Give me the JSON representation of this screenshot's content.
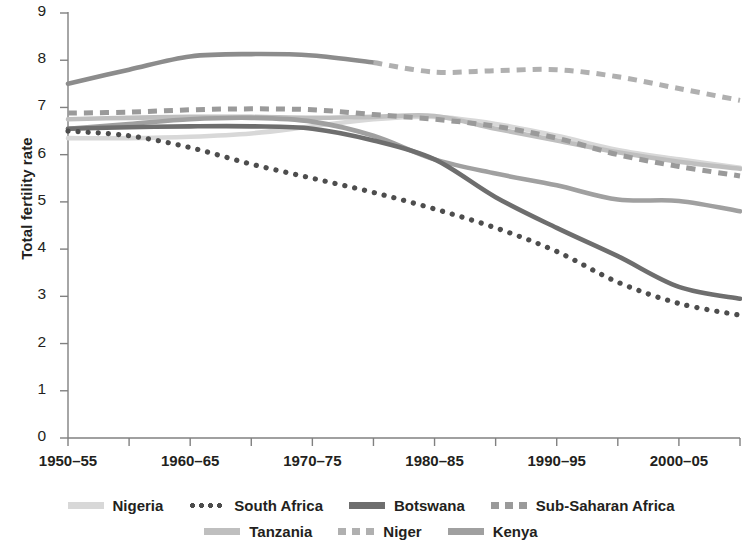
{
  "chart_data": {
    "type": "line",
    "title": "",
    "xlabel": "",
    "ylabel": "Total fertility rate",
    "ylim": [
      0,
      9
    ],
    "yticks": [
      0,
      1,
      2,
      3,
      4,
      5,
      6,
      7,
      8,
      9
    ],
    "grid": false,
    "legend_position": "bottom",
    "x": [
      "1950-55",
      "1955-60",
      "1960-65",
      "1965-70",
      "1970-75",
      "1975-80",
      "1980-85",
      "1985-90",
      "1990-95",
      "1995-2000",
      "2000-05",
      "2005-10"
    ],
    "xticks_labeled": [
      "1950–55",
      "1960–65",
      "1970–75",
      "1980–85",
      "1990–95",
      "2000–05"
    ],
    "series": [
      {
        "name": "Niger",
        "style": "solid-then-dashed",
        "color": "#8c8c8c",
        "values": [
          7.5,
          7.8,
          8.08,
          8.13,
          8.1,
          7.95,
          7.75,
          7.78,
          7.8,
          7.65,
          7.4,
          7.15
        ]
      },
      {
        "name": "Sub-Saharan Africa",
        "style": "dashed",
        "color": "#9a9a9a",
        "values": [
          6.88,
          6.9,
          6.95,
          6.97,
          6.95,
          6.85,
          6.75,
          6.6,
          6.35,
          6.0,
          5.75,
          5.55
        ]
      },
      {
        "name": "Tanzania",
        "style": "solid",
        "color": "#bfbfbf",
        "values": [
          6.75,
          6.78,
          6.8,
          6.8,
          6.78,
          6.8,
          6.82,
          6.55,
          6.3,
          6.05,
          5.85,
          5.7
        ]
      },
      {
        "name": "Nigeria",
        "style": "solid",
        "color": "#d8d8d8",
        "values": [
          6.35,
          6.35,
          6.38,
          6.45,
          6.6,
          6.75,
          6.8,
          6.65,
          6.4,
          6.1,
          5.9,
          5.72
        ]
      },
      {
        "name": "Kenya",
        "style": "solid",
        "color": "#a0a0a0",
        "values": [
          6.55,
          6.65,
          6.75,
          6.78,
          6.7,
          6.4,
          5.9,
          5.6,
          5.35,
          5.05,
          5.02,
          4.8
        ]
      },
      {
        "name": "Botswana",
        "style": "solid",
        "color": "#6e6e6e",
        "values": [
          6.55,
          6.58,
          6.6,
          6.6,
          6.55,
          6.3,
          5.9,
          5.1,
          4.45,
          3.85,
          3.2,
          2.95
        ]
      },
      {
        "name": "South Africa",
        "style": "dotted",
        "color": "#4d4d4d",
        "values": [
          6.5,
          6.4,
          6.15,
          5.8,
          5.5,
          5.2,
          4.85,
          4.45,
          3.95,
          3.3,
          2.85,
          2.6
        ]
      }
    ],
    "legend": [
      {
        "label": "Nigeria",
        "style": "solid",
        "color": "#d8d8d8"
      },
      {
        "label": "South Africa",
        "style": "dotted",
        "color": "#4d4d4d"
      },
      {
        "label": "Botswana",
        "style": "solid",
        "color": "#6e6e6e"
      },
      {
        "label": "Sub-Saharan Africa",
        "style": "dashed",
        "color": "#9a9a9a"
      },
      {
        "label": "Tanzania",
        "style": "solid",
        "color": "#bfbfbf"
      },
      {
        "label": "Niger",
        "style": "dashed",
        "color": "#b0b0b0"
      },
      {
        "label": "Kenya",
        "style": "solid",
        "color": "#a0a0a0"
      }
    ],
    "legend_rows": [
      [
        "Nigeria",
        "South Africa",
        "Botswana",
        "Sub-Saharan Africa"
      ],
      [
        "Tanzania",
        "Niger",
        "Kenya"
      ]
    ]
  },
  "axis": {
    "y_label": "Total fertility rate",
    "y_tick_labels": [
      "9",
      "8",
      "7",
      "6",
      "5",
      "4",
      "3",
      "2",
      "1",
      "0"
    ],
    "x_tick_labels": [
      "1950–55",
      "1960–65",
      "1970–75",
      "1980–85",
      "1990–95",
      "2000–05"
    ]
  },
  "legend_labels": {
    "nigeria": "Nigeria",
    "south_africa": "South Africa",
    "botswana": "Botswana",
    "sub_saharan_africa": "Sub-Saharan Africa",
    "tanzania": "Tanzania",
    "niger": "Niger",
    "kenya": "Kenya"
  }
}
